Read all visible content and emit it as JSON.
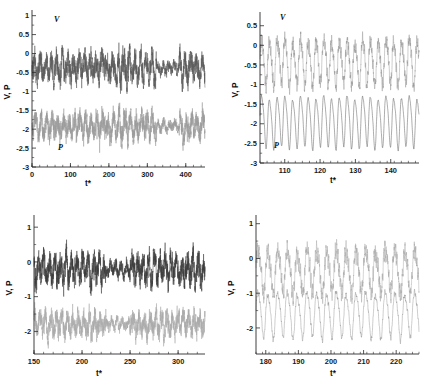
{
  "figure": {
    "background": "#ffffff",
    "colors": {
      "v_trace": "#5a5a5a",
      "p_trace": "#9a9a9a",
      "axis": "#2b2b2b"
    }
  },
  "chart_data": [
    {
      "id": "top-left",
      "type": "line",
      "title": "",
      "xlabel": "t*",
      "ylabel": "V, P",
      "xlim": [
        0,
        450
      ],
      "ylim": [
        -3,
        1.15
      ],
      "xticks": [
        0,
        100,
        200,
        300,
        400
      ],
      "xticklabels": [
        "0",
        "100",
        "200",
        "300",
        "400"
      ],
      "yticks": [
        1,
        0.5,
        0,
        -0.5,
        -1,
        -1.5,
        -2,
        -2.5,
        -3
      ],
      "yticklabels": [
        "1",
        "0.5",
        "0",
        "-0.5",
        "-1",
        "-1.5",
        "-2",
        "-2.5",
        "-3"
      ],
      "grid": false,
      "legend": "inline-annotations",
      "annotations": [
        {
          "text": "V",
          "x": 55,
          "y": 0.92
        },
        {
          "text": "P",
          "x": 62,
          "y": -2.55
        }
      ],
      "series": [
        {
          "name": "V",
          "color": "#5a5a5a",
          "mean": -0.38,
          "amplitude": 0.62,
          "description": "broadband chaotic velocity signal oscillating about -0.4, peaks to +1"
        },
        {
          "name": "P",
          "color": "#9a9a9a",
          "mean": -1.92,
          "amplitude": 0.58,
          "description": "broadband chaotic pressure signal oscillating about -1.9, troughs to -3"
        }
      ]
    },
    {
      "id": "top-right",
      "type": "line",
      "title": "",
      "xlabel": "t*",
      "ylabel": "V, P",
      "xlim": [
        103,
        148
      ],
      "ylim": [
        -3,
        0.85
      ],
      "xticks": [
        110,
        120,
        130,
        140
      ],
      "xticklabels": [
        "110",
        "120",
        "130",
        "140"
      ],
      "yticks": [
        0.5,
        0,
        -0.5,
        -1,
        -1.5,
        -2,
        -2.5,
        -3
      ],
      "yticklabels": [
        "0.5",
        "0",
        "-0.5",
        "-1",
        "-1.5",
        "-2",
        "-2.5",
        "-3"
      ],
      "grid": false,
      "legend": "inline-annotations",
      "annotations": [
        {
          "text": "V",
          "x": 107.5,
          "y": 0.62
        },
        {
          "text": "P",
          "x": 106.5,
          "y": -2.58
        }
      ],
      "series": [
        {
          "name": "V",
          "color": "#9a9a9a",
          "mean": -0.42,
          "amplitude": 0.55,
          "period": 2.2,
          "description": "zoomed quasi-periodic velocity with fine-scale jitter"
        },
        {
          "name": "P",
          "color": "#5a5a5a",
          "mean": -1.92,
          "amplitude": 0.62,
          "period": 2.2,
          "description": "zoomed smooth near-sinusoidal pressure oscillation"
        }
      ]
    },
    {
      "id": "bottom-left",
      "type": "line",
      "title": "",
      "xlabel": "t*",
      "ylabel": "V, P",
      "xlim": [
        150,
        328
      ],
      "ylim": [
        -2.65,
        1.35
      ],
      "xticks": [
        150,
        200,
        250,
        300
      ],
      "xticklabels": [
        "150",
        "200",
        "250",
        "300"
      ],
      "yticks": [
        1,
        0,
        -1,
        -2
      ],
      "yticklabels": [
        "1",
        "0",
        "-1",
        "-2"
      ],
      "grid": false,
      "legend": "none",
      "annotations": [],
      "series": [
        {
          "name": "V",
          "color": "#3d3d3d",
          "mean": -0.2,
          "amplitude": 0.72,
          "description": "dense chaotic velocity record, peaks near +1"
        },
        {
          "name": "P",
          "color": "#aaaaaa",
          "mean": -1.8,
          "amplitude": 0.6,
          "description": "dense chaotic pressure record, troughs near -2.6"
        }
      ]
    },
    {
      "id": "bottom-right",
      "type": "line",
      "title": "",
      "xlabel": "t*",
      "ylabel": "V, P",
      "xlim": [
        177,
        227
      ],
      "ylim": [
        -2.75,
        1.25
      ],
      "xticks": [
        180,
        190,
        200,
        210,
        220
      ],
      "xticklabels": [
        "180",
        "190",
        "200",
        "210",
        "220"
      ],
      "yticks": [
        1,
        0,
        -1,
        -2
      ],
      "yticklabels": [
        "1",
        "0",
        "-1",
        "-2"
      ],
      "grid": false,
      "legend": "none",
      "annotations": [],
      "series": [
        {
          "name": "V",
          "color": "#9a9a9a",
          "mean": -0.35,
          "amplitude": 0.6,
          "period": 3.0,
          "description": "zoomed velocity with sharp upward spikes to +1"
        },
        {
          "name": "P",
          "color": "#8d8d8d",
          "mean": -1.6,
          "amplitude": 0.62,
          "period": 3.0,
          "description": "zoomed oscillatory pressure dipping to -2.6"
        }
      ]
    }
  ]
}
